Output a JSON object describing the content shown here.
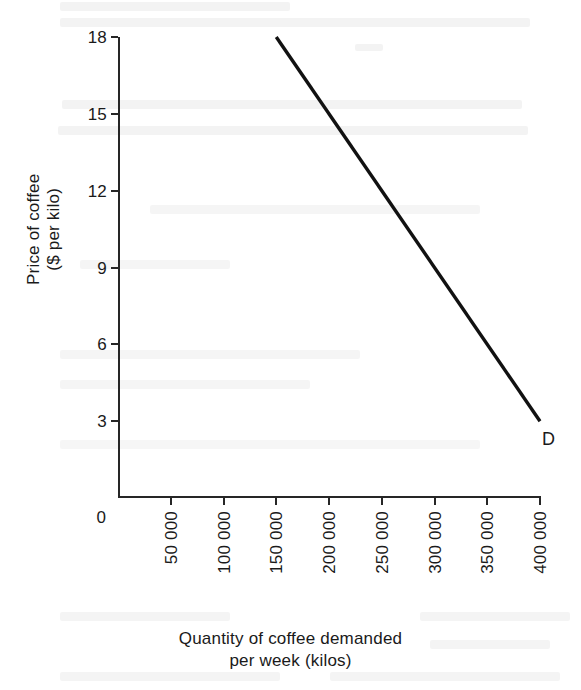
{
  "chart_data": {
    "type": "line",
    "title": "",
    "xlabel": "Quantity of coffee demanded per week (kilos)",
    "ylabel": "Price of coffee ($ per kilo)",
    "xlim": [
      0,
      400000
    ],
    "ylim": [
      0,
      18
    ],
    "grid": false,
    "legend": "none",
    "x_tick_labels": [
      "50 000",
      "100 000",
      "150 000",
      "200 000",
      "250 000",
      "300 000",
      "350 000",
      "400 000"
    ],
    "x_tick_values": [
      50000,
      100000,
      150000,
      200000,
      250000,
      300000,
      350000,
      400000
    ],
    "y_tick_labels": [
      "3",
      "6",
      "9",
      "12",
      "15",
      "18"
    ],
    "y_tick_values": [
      3,
      6,
      9,
      12,
      15,
      18
    ],
    "origin_label": "0",
    "series": [
      {
        "name": "D",
        "label": "D",
        "color": "#111111",
        "x": [
          150000,
          400000
        ],
        "values": [
          18,
          3
        ],
        "points": [
          {
            "x": 150000,
            "y": 18
          },
          {
            "x": 200000,
            "y": 15
          },
          {
            "x": 250000,
            "y": 12
          },
          {
            "x": 300000,
            "y": 9
          },
          {
            "x": 350000,
            "y": 6
          },
          {
            "x": 400000,
            "y": 3
          }
        ]
      }
    ]
  },
  "axes": {
    "y_title_line1": "Price of coffee",
    "y_title_line2": "($ per kilo)",
    "x_title_line1": "Quantity of coffee demanded",
    "x_title_line2": "per week (kilos)",
    "origin": "0",
    "axis_color": "#262626"
  },
  "curve": {
    "label": "D"
  }
}
